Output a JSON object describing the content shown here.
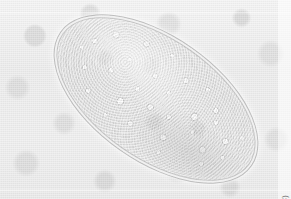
{
  "figure": {
    "name": "photomicrograph",
    "alt_subject": "parasite egg",
    "credit": "Source: Centers for Disease Control and Prevention (CDC)",
    "width": 291,
    "height": 199,
    "background_color": "#ededed",
    "specimen_color": "#e4e4e4",
    "credit_text_color": "#6f6f6f"
  },
  "specimen": {
    "shape": "ellipse",
    "center_x": 156,
    "center_y": 99,
    "major_axis": 232,
    "minor_axis": 124,
    "rotation_deg": 35,
    "interior": "granular cytoplasm with numerous refractile vesicles"
  }
}
